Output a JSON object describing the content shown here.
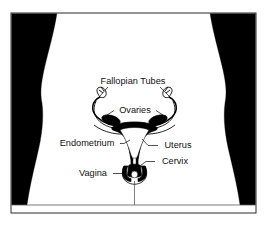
{
  "figure": {
    "frame": {
      "border_color": "#2b2b2b",
      "background_color": "#ffffff",
      "silhouette_color": "#000000",
      "body_color": "#ffffff",
      "x": 11,
      "y": 13,
      "width": 245,
      "height": 200
    },
    "labels": [
      {
        "id": "fallopian-tubes",
        "text": "Fallopian Tubes",
        "x": 133,
        "y": 84
      },
      {
        "id": "ovaries",
        "text": "Ovaries",
        "x": 135,
        "y": 113
      },
      {
        "id": "endometrium",
        "text": "Endometrium",
        "x": 87,
        "y": 146
      },
      {
        "id": "uterus",
        "text": "Uterus",
        "x": 178,
        "y": 148
      },
      {
        "id": "cervix",
        "text": "Cervix",
        "x": 175,
        "y": 164
      },
      {
        "id": "vagina",
        "text": "Vagina",
        "x": 93,
        "y": 176
      }
    ],
    "organs": [
      "fallopian-tubes",
      "ovaries",
      "uterus",
      "endometrium",
      "cervix",
      "vagina"
    ],
    "colors": {
      "ink": "#000000",
      "label_text": "#111111",
      "leader_line": "#1a1a1a",
      "silhouette": "#000000",
      "paper": "#ffffff",
      "frame_border": "#2b2b2b"
    }
  }
}
